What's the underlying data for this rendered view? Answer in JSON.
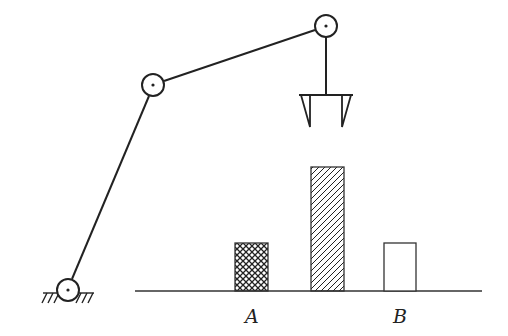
{
  "diagram": {
    "type": "robot-arm-pick-and-place",
    "stroke_color": "#222222",
    "arm": {
      "base_joint": {
        "x": 68,
        "y": 290,
        "r": 11
      },
      "elbow_joint": {
        "x": 153,
        "y": 85,
        "r": 11
      },
      "wrist_joint": {
        "x": 326,
        "y": 26,
        "r": 11
      },
      "gripper": {
        "bar_y": 95,
        "bar_x1": 299,
        "bar_x2": 353,
        "finger_tip_y": 127
      }
    },
    "ground": {
      "y": 291,
      "x1": 135,
      "x2": 482
    },
    "blocks": [
      {
        "name": "block-a",
        "pattern": "crosshatch",
        "x": 235,
        "y": 243,
        "w": 33,
        "h": 48
      },
      {
        "name": "block-middle",
        "pattern": "diagonal-hatch",
        "x": 311,
        "y": 167,
        "w": 33,
        "h": 124
      },
      {
        "name": "block-b",
        "pattern": "empty",
        "x": 384,
        "y": 243,
        "w": 32,
        "h": 48
      }
    ],
    "labels": {
      "a": "A",
      "b": "B"
    }
  }
}
